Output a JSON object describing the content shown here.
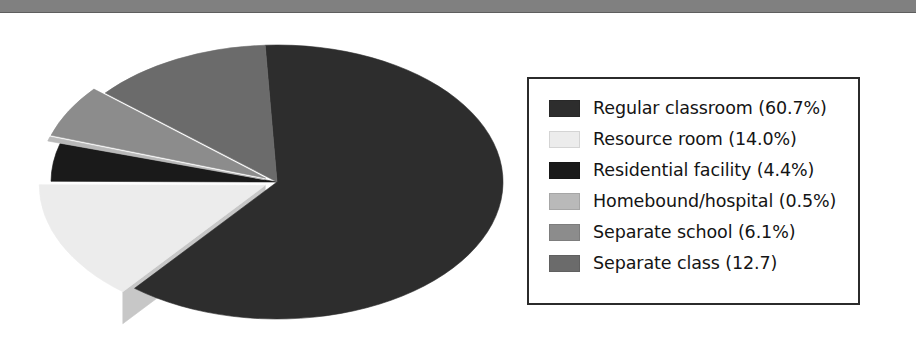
{
  "page": {
    "width": 919,
    "height": 361,
    "background": "#ffffff"
  },
  "top_bar": {
    "name": "horizontal-rule",
    "color": "#808080"
  },
  "legend": {
    "border_color": "#2b2b2b",
    "background": "#ffffff",
    "items": [
      {
        "label": "Regular classroom (60.7%)",
        "color": "#2d2d2d"
      },
      {
        "label": "Resource room (14.0%)",
        "color": "#ececec"
      },
      {
        "label": "Residential facility (4.4%)",
        "color": "#1a1a1a"
      },
      {
        "label": "Homebound/hospital (0.5%)",
        "color": "#b9b9b9"
      },
      {
        "label": "Separate school (6.1%)",
        "color": "#8c8c8c"
      },
      {
        "label": "Separate class (12.7)",
        "color": "#6b6b6b"
      }
    ]
  },
  "chart_data": {
    "type": "pie",
    "title": "",
    "subtitle": "",
    "xlabel": "",
    "ylabel": "",
    "grid": false,
    "legend_position": "right",
    "three_d": true,
    "exploded_slices": [
      "Resource room",
      "Homebound/hospital",
      "Separate school"
    ],
    "units": "percent",
    "categories": [
      "Regular classroom",
      "Resource room",
      "Residential facility",
      "Homebound/hospital",
      "Separate school",
      "Separate class"
    ],
    "values": [
      60.7,
      14.0,
      4.4,
      0.5,
      6.1,
      12.7
    ],
    "labels": [
      "Regular classroom (60.7%)",
      "Resource room (14.0%)",
      "Residential facility (4.4%)",
      "Homebound/hospital (0.5%)",
      "Separate school (6.1%)",
      "Separate class (12.7)"
    ],
    "colors": [
      "#2d2d2d",
      "#ececec",
      "#1a1a1a",
      "#b9b9b9",
      "#8c8c8c",
      "#6b6b6b"
    ],
    "side_colors": [
      "#232323",
      "#c7c7c7",
      "#121212",
      "#9c9c9c",
      "#747474",
      "#585858"
    ],
    "geometry": {
      "cx": 239,
      "cy": 150,
      "rx": 226,
      "ry": 137,
      "depth": 32,
      "start_angle_deg": 267,
      "direction": "clockwise"
    }
  }
}
